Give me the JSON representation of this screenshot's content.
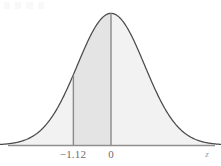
{
  "figure": {
    "kind": "standard-normal-curve",
    "caption": "",
    "artifact_note": ""
  },
  "axis": {
    "variable_label": "z",
    "tick_labels": [
      "-1.12",
      "0"
    ],
    "tick_label_neg": "−1.12",
    "tick_label_zero": "0"
  },
  "colors": {
    "curve_stroke": "#4a4a4a",
    "axis_stroke": "#8f8f8f",
    "vline_stroke": "#8a8a8a",
    "fill_outer": "#f2f2f2",
    "fill_inner": "#e4e4e4",
    "label_text": "#6d6d6d",
    "axis_label_text": "#9a9a9a",
    "background": "#ffffff"
  },
  "chart_data": {
    "type": "area",
    "title": "",
    "subtitle": "",
    "xlabel": "z",
    "ylabel": "",
    "grid": false,
    "legend": null,
    "distribution": "standard normal",
    "mean": 0,
    "sd": 1,
    "xlim": [
      -3.6,
      3.6
    ],
    "ylim": [
      0,
      0.4
    ],
    "marked_z_values": [
      -1.12,
      0
    ],
    "shaded_region": {
      "from": -1.12,
      "to": 0,
      "note": "darker shading between -1.12 and 0"
    },
    "x": [
      -3.6,
      -3.4,
      -3.2,
      -3.0,
      -2.8,
      -2.6,
      -2.4,
      -2.2,
      -2.0,
      -1.8,
      -1.6,
      -1.4,
      -1.2,
      -1.12,
      -1.0,
      -0.8,
      -0.6,
      -0.4,
      -0.2,
      0.0,
      0.2,
      0.4,
      0.6,
      0.8,
      1.0,
      1.2,
      1.4,
      1.6,
      1.8,
      2.0,
      2.2,
      2.4,
      2.6,
      2.8,
      3.0,
      3.2,
      3.4,
      3.6
    ],
    "y": [
      0.0006,
      0.0012,
      0.0024,
      0.0044,
      0.0079,
      0.0136,
      0.0224,
      0.0355,
      0.054,
      0.079,
      0.1109,
      0.1497,
      0.1942,
      0.2131,
      0.242,
      0.2897,
      0.3332,
      0.3683,
      0.391,
      0.3989,
      0.391,
      0.3683,
      0.3332,
      0.2897,
      0.242,
      0.1942,
      0.1497,
      0.1109,
      0.079,
      0.054,
      0.0355,
      0.0224,
      0.0136,
      0.0079,
      0.0044,
      0.0024,
      0.0012,
      0.0006
    ]
  }
}
